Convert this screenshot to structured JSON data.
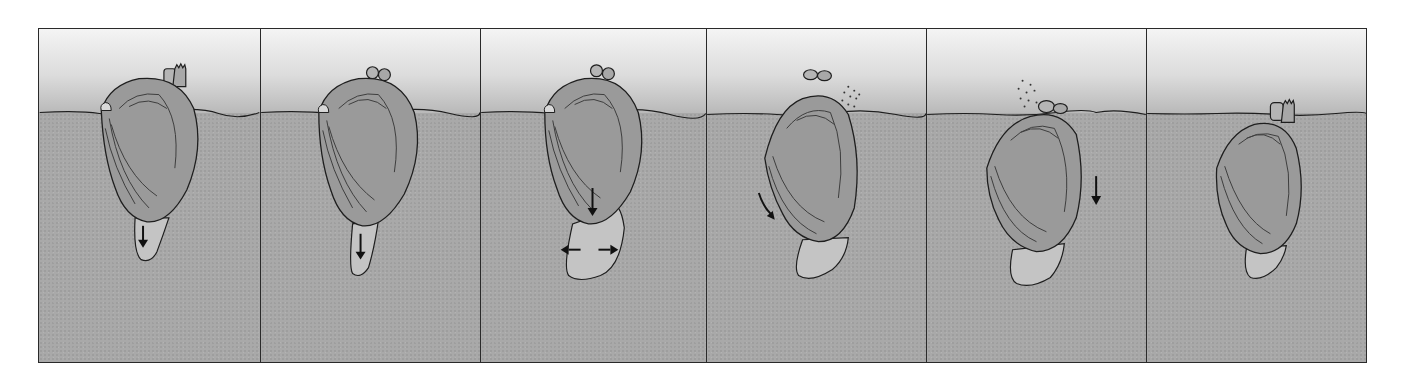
{
  "figure": {
    "panel_count": 6,
    "colors": {
      "water_top": "#f4f4f4",
      "water_bottom": "#b9b9b9",
      "sediment": "#a9a9a9",
      "shell": "#9a9a9a",
      "foot": "#c4c4c4",
      "outline": "#1e1e1e",
      "frame": "#2a2a2a"
    },
    "panels": [
      {
        "index": 1,
        "stage": "foot-probing",
        "arrows": [
          "down"
        ],
        "particles": false
      },
      {
        "index": 2,
        "stage": "foot-extending",
        "arrows": [
          "down"
        ],
        "particles": true
      },
      {
        "index": 3,
        "stage": "foot-anchoring",
        "arrows": [
          "down",
          "left",
          "right"
        ],
        "particles": true
      },
      {
        "index": 4,
        "stage": "shell-pulled-down",
        "arrows": [
          "down-rotate"
        ],
        "particles": true
      },
      {
        "index": 5,
        "stage": "shell-pulled-down",
        "arrows": [
          "down"
        ],
        "particles": true
      },
      {
        "index": 6,
        "stage": "buried",
        "arrows": [],
        "particles": false
      }
    ]
  }
}
